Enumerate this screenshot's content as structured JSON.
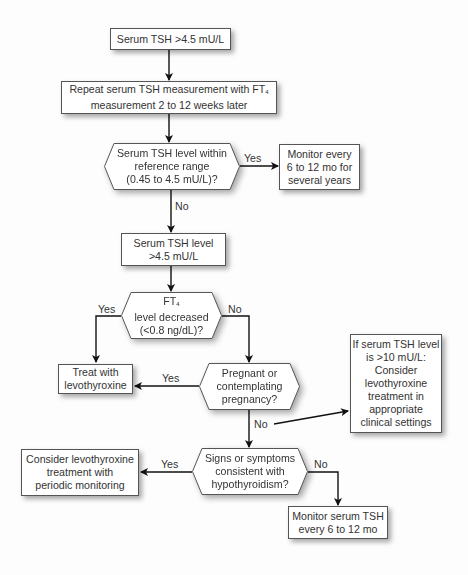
{
  "diagram": {
    "type": "flowchart",
    "nodes": {
      "start": {
        "shape": "box",
        "lines": [
          "Serum TSH >4.5 mU/L"
        ]
      },
      "repeat": {
        "shape": "box",
        "lines": [
          "Repeat serum TSH measurement with FT",
          "measurement 2 to 12 weeks later"
        ],
        "subscript": "4"
      },
      "within_range": {
        "shape": "hexagon",
        "lines": [
          "Serum TSH level within",
          "reference range",
          "(0.45 to 4.5 mU/L)?"
        ]
      },
      "monitor_years": {
        "shape": "box",
        "lines": [
          "Monitor every",
          "6 to 12 mo for",
          "several years"
        ]
      },
      "tsh_high": {
        "shape": "box",
        "lines": [
          "Serum TSH level",
          ">4.5 mU/L"
        ]
      },
      "ft4_decreased": {
        "shape": "hexagon",
        "lines": [
          "FT",
          "level decreased",
          "(<0.8 ng/dL)?"
        ],
        "subscript": "4"
      },
      "treat": {
        "shape": "box",
        "lines": [
          "Treat with",
          "levothyroxine"
        ]
      },
      "pregnant": {
        "shape": "hexagon",
        "lines": [
          "Pregnant or",
          "contemplating",
          "pregnancy?"
        ]
      },
      "tsh_over_10": {
        "shape": "box",
        "lines": [
          "If serum TSH level",
          "is >10 mU/L:",
          "Consider",
          "levothyroxine",
          "treatment in",
          "appropriate",
          "clinical settings"
        ]
      },
      "signs_symptoms": {
        "shape": "hexagon",
        "lines": [
          "Signs or symptoms",
          "consistent with",
          "hypothyroidism?"
        ]
      },
      "consider_periodic": {
        "shape": "box",
        "lines": [
          "Consider levothyroxine",
          "treatment with",
          "periodic monitoring"
        ]
      },
      "monitor_tsh": {
        "shape": "box",
        "lines": [
          "Monitor serum TSH",
          "every 6 to 12 mo"
        ]
      }
    },
    "edge_labels": {
      "within_yes": "Yes",
      "within_no": "No",
      "ft4_yes": "Yes",
      "ft4_no": "No",
      "pregnant_yes": "Yes",
      "pregnant_no": "No",
      "signs_yes": "Yes",
      "signs_no": "No"
    },
    "edges": [
      {
        "from": "start",
        "to": "repeat",
        "label": ""
      },
      {
        "from": "repeat",
        "to": "within_range",
        "label": ""
      },
      {
        "from": "within_range",
        "to": "monitor_years",
        "label": "Yes"
      },
      {
        "from": "within_range",
        "to": "tsh_high",
        "label": "No"
      },
      {
        "from": "tsh_high",
        "to": "ft4_decreased",
        "label": ""
      },
      {
        "from": "ft4_decreased",
        "to": "treat",
        "label": "Yes"
      },
      {
        "from": "ft4_decreased",
        "to": "pregnant",
        "label": "No"
      },
      {
        "from": "pregnant",
        "to": "treat",
        "label": "Yes"
      },
      {
        "from": "pregnant",
        "to": "tsh_over_10",
        "label": "No"
      },
      {
        "from": "pregnant",
        "to": "signs_symptoms",
        "label": "No"
      },
      {
        "from": "signs_symptoms",
        "to": "consider_periodic",
        "label": "Yes"
      },
      {
        "from": "signs_symptoms",
        "to": "monitor_tsh",
        "label": "No"
      }
    ],
    "colors": {
      "stroke": "#1a1a1a",
      "box_border": "#555555",
      "fill": "#ffffff",
      "text": "#333333"
    }
  }
}
